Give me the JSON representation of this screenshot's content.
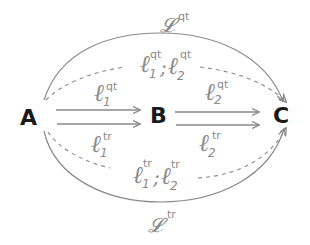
{
  "nodes": {
    "a": {
      "label": "A"
    },
    "b": {
      "label": "B"
    },
    "c": {
      "label": "C"
    }
  },
  "edges": {
    "ab_qt": {
      "symbol": "ℓ",
      "sub": "1",
      "sup": "qt"
    },
    "ab_tr": {
      "symbol": "ℓ",
      "sub": "1",
      "sup": "tr"
    },
    "bc_qt": {
      "symbol": "ℓ",
      "sub": "2",
      "sup": "qt"
    },
    "bc_tr": {
      "symbol": "ℓ",
      "sub": "2",
      "sup": "tr"
    },
    "composite_qt": {
      "symbol1": "ℓ",
      "sub1": "1",
      "sup1": "qt",
      "sep": ";",
      "symbol2": "ℓ",
      "sub2": "2",
      "sup2": "qt"
    },
    "composite_tr": {
      "symbol1": "ℓ",
      "sub1": "1",
      "sup1": "tr",
      "sep": ";",
      "symbol2": "ℓ",
      "sub2": "2",
      "sup2": "tr"
    },
    "direct_qt": {
      "symbol": "𝓛",
      "sup": "qt"
    },
    "direct_tr": {
      "symbol": "𝓛",
      "sup": "tr"
    }
  },
  "colors": {
    "node": "#1a1a1a",
    "edge": "#8a8a8a",
    "background": "#ffffff"
  }
}
